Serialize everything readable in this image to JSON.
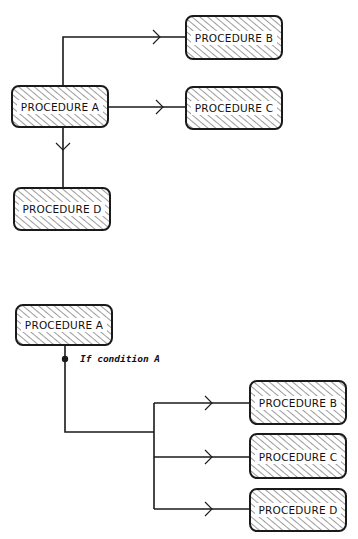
{
  "diagram_top": {
    "title": "Procedure call hierarchy (unconditional)",
    "nodes": [
      {
        "id": "A",
        "label": "PROCEDURE A",
        "x": 12,
        "y": 86,
        "w": 96,
        "h": 41
      },
      {
        "id": "B",
        "label": "PROCEDURE B",
        "x": 186,
        "y": 16,
        "w": 96,
        "h": 43
      },
      {
        "id": "C",
        "label": "PROCEDURE C",
        "x": 186,
        "y": 87,
        "w": 96,
        "h": 42
      },
      {
        "id": "D",
        "label": "PROCEDURE D",
        "x": 14,
        "y": 188,
        "w": 96,
        "h": 42
      }
    ],
    "edges": [
      {
        "from": "A",
        "to": "B"
      },
      {
        "from": "A",
        "to": "C"
      },
      {
        "from": "A",
        "to": "D"
      }
    ]
  },
  "diagram_bottom": {
    "title": "Procedure call hierarchy (conditional)",
    "nodes": [
      {
        "id": "A",
        "label": "PROCEDURE A",
        "x": 16,
        "y": 305,
        "w": 96,
        "h": 40
      },
      {
        "id": "B",
        "label": "PROCEDURE B",
        "x": 250,
        "y": 381,
        "w": 96,
        "h": 43
      },
      {
        "id": "C",
        "label": "PROCEDURE C",
        "x": 250,
        "y": 434,
        "w": 96,
        "h": 44
      },
      {
        "id": "D",
        "label": "PROCEDURE D",
        "x": 250,
        "y": 489,
        "w": 96,
        "h": 42
      }
    ],
    "condition_label": "If condition A",
    "edges": [
      {
        "from": "A",
        "to": "B",
        "condition": "If condition A"
      },
      {
        "from": "A",
        "to": "C",
        "condition": "If condition A"
      },
      {
        "from": "A",
        "to": "D",
        "condition": "If condition A"
      }
    ]
  },
  "colors": {
    "stroke": "#1a1a1a",
    "hatch": "#3a3a3a",
    "box_fill": "#ffffff",
    "background": "#ffffff"
  }
}
